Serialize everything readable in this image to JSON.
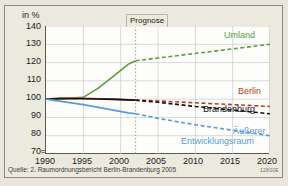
{
  "figure": {
    "axis_unit": "in %",
    "forecast_marker": "Prognose",
    "source": "Quelle: 2. Raumordnungsbericht Berlin-Brandenburg 2005",
    "code": "12800E"
  },
  "chart_data": {
    "type": "line",
    "title": "",
    "subtitle": "",
    "xlabel": "",
    "ylabel": "in %",
    "ylim": [
      70,
      140
    ],
    "xlim": [
      1990,
      2020
    ],
    "yticks": [
      140,
      130,
      120,
      110,
      100,
      90,
      80,
      70
    ],
    "xticks": [
      1990,
      1995,
      2000,
      2005,
      2010,
      2015,
      2020
    ],
    "grid": true,
    "axis_break_below": 70,
    "legend_position": "inline-right",
    "annotations": [
      {
        "text": "Prognose",
        "x": 2002,
        "note": "dotted vertical divider; solid lines left, dashed forecast right"
      }
    ],
    "x": [
      1990,
      1992,
      1995,
      1997,
      1999,
      2001,
      2002,
      2005,
      2010,
      2015,
      2020
    ],
    "series": [
      {
        "name": "Umland",
        "color": "#5e9c3f",
        "label": "Umland",
        "values": [
          100,
          100.3,
          101,
          106,
          112.5,
          119,
          121,
          122.5,
          125,
          127.5,
          130
        ]
      },
      {
        "name": "Berlin",
        "color": "#c0392b",
        "label": "Berlin",
        "values": [
          100,
          100.6,
          100.5,
          100.2,
          100,
          99.7,
          99.5,
          99,
          98,
          97,
          96
        ]
      },
      {
        "name": "Brandenburg",
        "color": "#111111",
        "label": "Brandenburg",
        "values": [
          100,
          100.2,
          100.2,
          100.1,
          99.9,
          99.6,
          99.4,
          98.3,
          96,
          94,
          92
        ]
      },
      {
        "name": "Äußerer Entwicklungsraum",
        "color": "#5b9bd5",
        "label_line1": "Äußerer",
        "label_line2": "Entwicklungsraum",
        "values": [
          100,
          98.8,
          97,
          95.5,
          94,
          92.5,
          92,
          89.5,
          86,
          83,
          80
        ]
      }
    ]
  }
}
